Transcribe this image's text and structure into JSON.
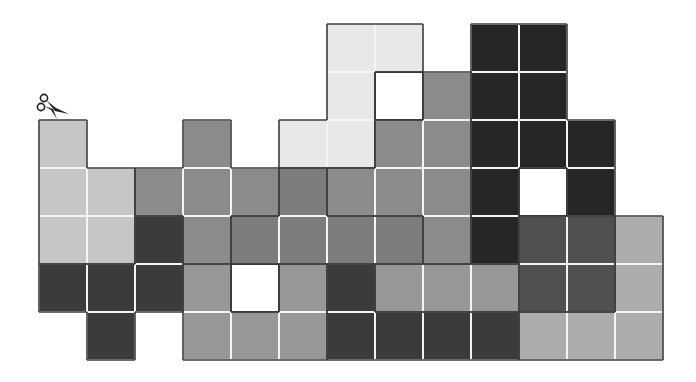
{
  "puzzle": {
    "origin": {
      "x": 39,
      "y": 24
    },
    "cell_size": 48,
    "columns": 13,
    "rows": 7,
    "palette": {
      "W": "#e8e8e8",
      "L": "#c6c6c6",
      "LM": "#acacac",
      "ML": "#979797",
      "M": "#8b8b8b",
      "MD": "#7c7c7c",
      "DG": "#505050",
      "D": "#3b3b3b",
      "K": "#262626",
      "H": "#ffffff"
    },
    "grid": [
      [
        null,
        null,
        null,
        null,
        null,
        null,
        "W",
        "W",
        null,
        "K",
        "K",
        null,
        null
      ],
      [
        null,
        null,
        null,
        null,
        null,
        null,
        "W",
        "H",
        "M",
        "K",
        "K",
        null,
        null
      ],
      [
        "L",
        null,
        null,
        "M",
        null,
        "W",
        "W",
        "M",
        "M",
        "K",
        "K",
        "K",
        null
      ],
      [
        "L",
        "L",
        "M",
        "M",
        "M",
        "MD",
        "M",
        "M",
        "M",
        "K",
        "H",
        "K",
        null
      ],
      [
        "L",
        "L",
        "D",
        "M",
        "MD",
        "MD",
        "MD",
        "MD",
        "M",
        "K",
        "DG",
        "DG",
        "LM"
      ],
      [
        "D",
        "D",
        "D",
        "ML",
        "H",
        "ML",
        "D",
        "ML",
        "ML",
        "ML",
        "DG",
        "DG",
        "LM"
      ],
      [
        null,
        "D",
        null,
        "ML",
        "ML",
        "ML",
        "D",
        "D",
        "D",
        "D",
        "LM",
        "LM",
        "LM"
      ]
    ],
    "outline_color": "#3a3a3a",
    "grid_line_color": "#f4f4f4"
  },
  "icons": {
    "scissors": "scissors-icon"
  }
}
